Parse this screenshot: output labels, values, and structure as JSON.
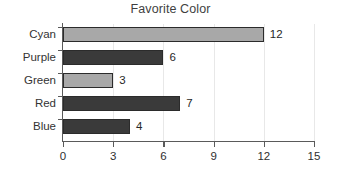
{
  "chart_data": {
    "type": "bar",
    "orientation": "horizontal",
    "title": "Favorite Color",
    "xlabel": "",
    "ylabel": "",
    "categories": [
      "Cyan",
      "Purple",
      "Green",
      "Red",
      "Blue"
    ],
    "values": [
      12,
      6,
      3,
      7,
      4
    ],
    "value_labels": [
      "12",
      "6",
      "3",
      "7",
      "4"
    ],
    "bar_styles": [
      "light",
      "dark",
      "light",
      "dark",
      "dark"
    ],
    "xlim": [
      0,
      15
    ],
    "xticks": [
      0,
      3,
      6,
      9,
      12,
      15
    ],
    "xtick_labels": [
      "0",
      "3",
      "6",
      "9",
      "12",
      "15"
    ],
    "grid": true,
    "legend": false,
    "colors": {
      "bar_light": "#a8a8a8",
      "bar_dark": "#3a3a3a",
      "bar_edge": "#2b2b2b",
      "axis": "#5a5a5a",
      "grid": "#e8e8e8",
      "title_text": "#3f3f3f",
      "label_text": "#333333",
      "background": "#ffffff"
    }
  }
}
